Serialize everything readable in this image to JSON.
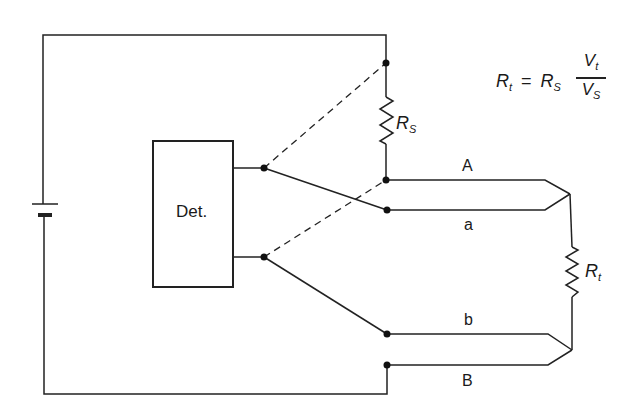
{
  "diagram": {
    "detector": {
      "label": "Det."
    },
    "resistors": {
      "reference": {
        "symbol": "R",
        "subscript": "S"
      },
      "test": {
        "symbol": "R",
        "subscript": "t"
      }
    },
    "wire_labels": {
      "A": "A",
      "a": "a",
      "b": "b",
      "B": "B"
    },
    "formula": {
      "lhs_symbol": "R",
      "lhs_sub": "t",
      "equals": "=",
      "rhs_symbol": "R",
      "rhs_sub": "S",
      "numerator_symbol": "V",
      "numerator_sub": "t",
      "denominator_symbol": "V",
      "denominator_sub": "S"
    },
    "colors": {
      "line": "#222222",
      "background": "#ffffff"
    }
  }
}
